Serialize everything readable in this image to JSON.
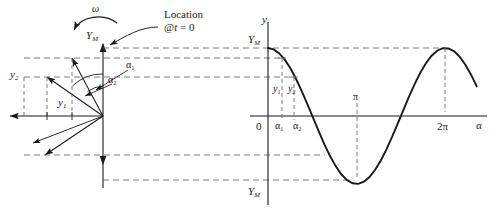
{
  "figure": {
    "kind": "phasor-to-sinusoid-construction",
    "background": "#ffffff",
    "ink": "#1a1a1a",
    "dash_color": "#7a7a7a",
    "width": 496,
    "height": 215
  },
  "phasor": {
    "omega_label": "ω",
    "peak_label_Y": "Y",
    "peak_label_sub": "M",
    "annotation_line1": "Location",
    "annotation_line2": "@t = 0",
    "annotation_at": "@",
    "annotation_t": "t",
    "annotation_eq0": " = 0",
    "angle1_label": "α",
    "angle1_sub": "1",
    "angle2_label": "α",
    "angle2_sub": "2",
    "proj1_label": "y",
    "proj1_sub": "1",
    "proj2_label": "y",
    "proj2_sub": "2",
    "origin_x": 103,
    "origin_y": 116,
    "radius": 60
  },
  "chart_data": {
    "type": "line",
    "title": "",
    "xlabel": "α",
    "ylabel": "y",
    "function": "y = Y_M cos(α)",
    "amplitude_label": "Y_M",
    "xlim": [
      0,
      7.6
    ],
    "ylim": [
      -1.15,
      1.15
    ],
    "grid": false,
    "legend": false,
    "axis_origin_label": "0",
    "xticks": [
      {
        "value": 0.52,
        "label": "α",
        "sub": "1"
      },
      {
        "value": 0.96,
        "label": "α",
        "sub": "2"
      },
      {
        "value": 3.14159,
        "label": "π",
        "sub": ""
      },
      {
        "value": 6.28319,
        "label": "2π",
        "sub": ""
      }
    ],
    "yticks": [
      {
        "value": 1.0,
        "label": "Y",
        "sub": "M"
      },
      {
        "value": -1.0,
        "label": "Y",
        "sub": "M"
      }
    ],
    "annotations": [
      {
        "label": "y",
        "sub": "1",
        "x": 0.52,
        "y": 0.868
      },
      {
        "label": "y",
        "sub": "2",
        "x": 0.96,
        "y": 0.574
      }
    ],
    "x": [
      0,
      0.2,
      0.4,
      0.6,
      0.8,
      1.0,
      1.2,
      1.4,
      1.6,
      1.8,
      2.0,
      2.2,
      2.4,
      2.6,
      2.8,
      3.0,
      3.2,
      3.4,
      3.6,
      3.8,
      4.0,
      4.2,
      4.4,
      4.6,
      4.8,
      5.0,
      5.2,
      5.4,
      5.6,
      5.8,
      6.0,
      6.2,
      6.4,
      6.6,
      6.8,
      7.0,
      7.2,
      7.4
    ],
    "y": [
      1.0,
      0.98,
      0.921,
      0.825,
      0.697,
      0.54,
      0.362,
      0.17,
      -0.029,
      -0.227,
      -0.416,
      -0.589,
      -0.737,
      -0.857,
      -0.942,
      -0.99,
      -0.998,
      -0.967,
      -0.897,
      -0.791,
      -0.654,
      -0.49,
      -0.307,
      -0.112,
      0.087,
      0.284,
      0.469,
      0.635,
      0.776,
      0.886,
      0.96,
      0.997,
      0.993,
      0.95,
      0.869,
      0.754,
      0.608,
      0.438
    ]
  },
  "axes": {
    "plot_origin_x": 268,
    "plot_axis_y": 116,
    "plot_amplitude_px": 68,
    "plot_x_per_rad": 28.2
  }
}
